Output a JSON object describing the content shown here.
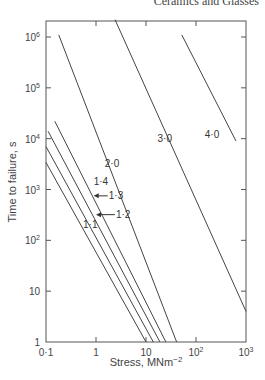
{
  "header": {
    "text": "Ceramics and Glasses"
  },
  "chart_data": {
    "type": "line",
    "title": "",
    "xlabel": "Stress, MNm",
    "xlabel_sup": "−2",
    "ylabel": "Time to failure, s",
    "xscale": "log",
    "yscale": "log",
    "xlim": [
      0.1,
      1000
    ],
    "ylim": [
      1,
      1000000
    ],
    "grid": false,
    "legend": "inline curve labels",
    "x_ticks": [
      {
        "value": 0.1,
        "label": "0·1"
      },
      {
        "value": 1,
        "label": "1"
      },
      {
        "value": 10,
        "label": "10"
      },
      {
        "value": 100,
        "label": "10",
        "sup": "2"
      },
      {
        "value": 1000,
        "label": "10",
        "sup": "3"
      }
    ],
    "y_ticks": [
      {
        "value": 1,
        "label": "1"
      },
      {
        "value": 10,
        "label": "10"
      },
      {
        "value": 100,
        "label": "10",
        "sup": "2"
      },
      {
        "value": 1000,
        "label": "10",
        "sup": "3"
      },
      {
        "value": 10000,
        "label": "10",
        "sup": "4"
      },
      {
        "value": 100000,
        "label": "10",
        "sup": "5"
      },
      {
        "value": 1000000,
        "label": "10",
        "sup": "6"
      }
    ],
    "series": [
      {
        "name": "1·1",
        "points": [
          [
            0.1,
            3400
          ],
          [
            10,
            1
          ]
        ]
      },
      {
        "name": "1·2",
        "points": [
          [
            0.1,
            7000
          ],
          [
            14,
            1
          ]
        ]
      },
      {
        "name": "1·3",
        "points": [
          [
            0.11,
            14000
          ],
          [
            19,
            1
          ]
        ]
      },
      {
        "name": "1·4",
        "points": [
          [
            0.15,
            22000
          ],
          [
            25,
            1
          ]
        ]
      },
      {
        "name": "2·0",
        "points": [
          [
            0.18,
            1100000
          ],
          [
            41,
            1
          ]
        ]
      },
      {
        "name": "3·0",
        "points": [
          [
            2.4,
            2200000
          ],
          [
            1000,
            4
          ]
        ]
      },
      {
        "name": "4·0",
        "points": [
          [
            52,
            1100000
          ],
          [
            630,
            9000
          ]
        ]
      }
    ],
    "annotations": [
      {
        "text": "1·1",
        "x": 0.55,
        "y": 200
      },
      {
        "text": "1·2",
        "x": 2.5,
        "y": 320,
        "arrow_to": [
          1,
          320
        ]
      },
      {
        "text": "1·3",
        "x": 1.8,
        "y": 750,
        "arrow_to": [
          0.9,
          750
        ]
      },
      {
        "text": "1·4",
        "x": 0.9,
        "y": 1400
      },
      {
        "text": "2·0",
        "x": 1.5,
        "y": 3200
      },
      {
        "text": "3·0",
        "x": 17,
        "y": 10000
      },
      {
        "text": "4·0",
        "x": 150,
        "y": 12000
      }
    ]
  }
}
